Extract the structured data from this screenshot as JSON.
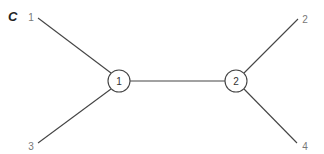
{
  "figure": {
    "panel_label": "C",
    "type": "unrooted tree / network diagram",
    "internal_nodes": [
      {
        "id": "node-1",
        "label": "1",
        "cx": 119,
        "cy": 81,
        "r": 11
      },
      {
        "id": "node-2",
        "label": "2",
        "cx": 236,
        "cy": 81,
        "r": 11
      }
    ],
    "leaves": [
      {
        "id": "leaf-1",
        "label": "1",
        "x": 31,
        "y": 21,
        "line_x": 38,
        "line_y": 18,
        "attached_to": "node-1"
      },
      {
        "id": "leaf-3",
        "label": "3",
        "x": 31,
        "y": 150,
        "line_x": 38,
        "line_y": 143,
        "attached_to": "node-1"
      },
      {
        "id": "leaf-2",
        "label": "2",
        "x": 305,
        "y": 23,
        "line_x": 298,
        "line_y": 19,
        "attached_to": "node-2"
      },
      {
        "id": "leaf-4",
        "label": "4",
        "x": 305,
        "y": 150,
        "line_x": 297,
        "line_y": 143,
        "attached_to": "node-2"
      }
    ],
    "colors": {
      "line": "#444444",
      "leaf_text": "#777777",
      "node_text": "#333333",
      "panel_text": "#222222",
      "background": "#ffffff"
    }
  }
}
